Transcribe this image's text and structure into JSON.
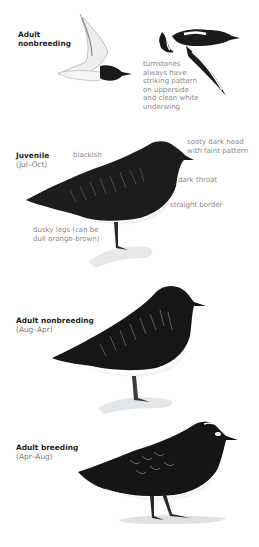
{
  "plate": {
    "figures": [
      {
        "id": "flight",
        "title": "Adult",
        "title_line2": "nonbreeding",
        "notes": [
          {
            "lines": [
              "turnstones",
              "always have",
              "striking pattern",
              "on upperside",
              "and clean white",
              "underwing"
            ]
          }
        ]
      },
      {
        "id": "juvenile",
        "title": "Juvenile",
        "season": "(Jul–Oct)",
        "notes": [
          {
            "lines": [
              "blackish"
            ]
          },
          {
            "lines": [
              "sooty dark head",
              "with faint pattern"
            ]
          },
          {
            "lines": [
              "dark throat"
            ]
          },
          {
            "lines": [
              "straight border"
            ]
          },
          {
            "lines": [
              "dusky legs (can be",
              "dull orange-brown)"
            ]
          }
        ]
      },
      {
        "id": "adult-nonbreeding",
        "title": "Adult nonbreeding",
        "season": "(Aug–Apr)"
      },
      {
        "id": "adult-breeding",
        "title": "Adult breeding",
        "season": "(Apr–Aug)"
      }
    ],
    "colors": {
      "plumage_dark": "#1a1a1a",
      "belly": "#f4f4f4",
      "rock": "#d9dcdf",
      "title_text": "#1f1f1f",
      "note_text": "#8a8a8a"
    }
  }
}
